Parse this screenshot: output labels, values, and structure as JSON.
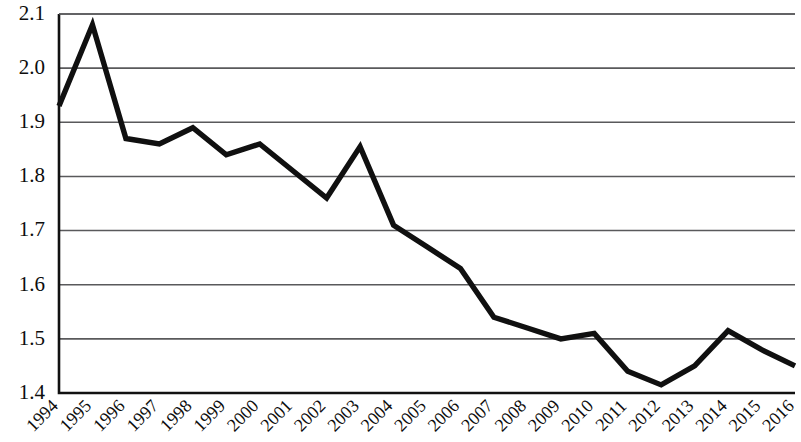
{
  "chart_data": {
    "type": "line",
    "title": "",
    "subtitle": "",
    "xlabel": "",
    "ylabel": "",
    "x": [
      "1994",
      "1995",
      "1996",
      "1997",
      "1998",
      "1999",
      "2000",
      "2001",
      "2002",
      "2003",
      "2004",
      "2005",
      "2006",
      "2007",
      "2008",
      "2009",
      "2010",
      "2011",
      "2012",
      "2013",
      "2014",
      "2015",
      "2016"
    ],
    "categories": [
      "1994",
      "1995",
      "1996",
      "1997",
      "1998",
      "1999",
      "2000",
      "2001",
      "2002",
      "2003",
      "2004",
      "2005",
      "2006",
      "2007",
      "2008",
      "2009",
      "2010",
      "2011",
      "2012",
      "2013",
      "2014",
      "2015",
      "2016"
    ],
    "values": [
      1.93,
      2.08,
      1.87,
      1.86,
      1.89,
      1.84,
      1.86,
      1.81,
      1.76,
      1.855,
      1.71,
      1.67,
      1.63,
      1.54,
      1.52,
      1.5,
      1.51,
      1.44,
      1.415,
      1.45,
      1.515,
      1.48,
      1.45
    ],
    "series": [
      {
        "name": "series-1",
        "color": "#101010",
        "values": [
          1.93,
          2.08,
          1.87,
          1.86,
          1.89,
          1.84,
          1.86,
          1.81,
          1.76,
          1.855,
          1.71,
          1.67,
          1.63,
          1.54,
          1.52,
          1.5,
          1.51,
          1.44,
          1.415,
          1.45,
          1.515,
          1.48,
          1.45
        ]
      }
    ],
    "ylim": [
      1.4,
      2.1
    ],
    "xlim": [
      "1994",
      "2016"
    ],
    "yticks": [
      1.4,
      1.5,
      1.6,
      1.7,
      1.8,
      1.9,
      2.0,
      2.1
    ],
    "ytick_labels": [
      "1.4",
      "1.5",
      "1.6",
      "1.7",
      "1.8",
      "1.9",
      "2.0",
      "2.1"
    ],
    "xtick_labels": [
      "1994",
      "1995",
      "1996",
      "1997",
      "1998",
      "1999",
      "2000",
      "2001",
      "2002",
      "2003",
      "2004",
      "2005",
      "2006",
      "2007",
      "2008",
      "2009",
      "2010",
      "2011",
      "2012",
      "2013",
      "2014",
      "2015",
      "2016"
    ],
    "grid": true,
    "grid_axis": "y",
    "legend": false,
    "legend_position": "none",
    "line_color": "#101010",
    "gridline_color": "#59595b",
    "axis_color": "#111111",
    "background_color": "#ffffff",
    "xtick_label_rotation": -45,
    "markers": false,
    "annotations": []
  }
}
